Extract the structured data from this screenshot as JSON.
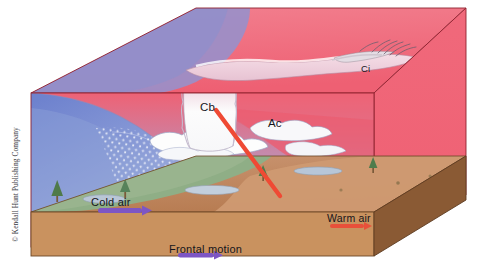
{
  "figure": {
    "credit": "© Kendall Hunt Publishing Company"
  },
  "labels": {
    "cb": "Cb",
    "ac": "Ac",
    "ci": "Ci",
    "cold_air": "Cold air",
    "warm_air": "Warm air",
    "frontal_motion": "Frontal motion"
  },
  "colors": {
    "warm_air_pink": "#ef6476",
    "warm_air_pink_light": "#f2808f",
    "cold_air_blue": "#6f83cf",
    "cold_air_blue_light": "#93a4da",
    "haze_violet": "#b9a7cf",
    "cloud_white": "#fbfbfb",
    "cloud_pink": "#e8bcce",
    "ground_green": "#8fae86",
    "ground_brown": "#c08a5e",
    "ground_brown_dark": "#8a5a34",
    "ground_tan": "#cf9a72",
    "arrow_red": "#ef4a34",
    "arrow_purple": "#7d56c4",
    "outline": "#8e2230",
    "text": "#15151c"
  },
  "elements": {
    "cold_air_marker": "purple-arrow-bar",
    "warm_air_marker": "red-arrow-bar",
    "frontal_motion_marker": "purple-arrow",
    "red_pointer": "cb-pointer-arrow",
    "trees": 4,
    "lakes": 3
  }
}
